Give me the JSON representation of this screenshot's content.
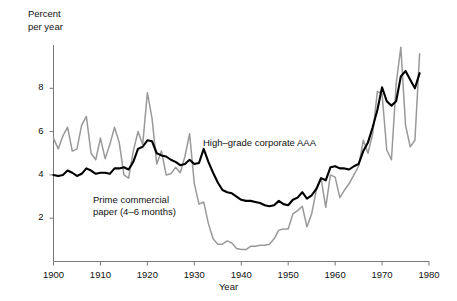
{
  "chart_data": {
    "type": "line",
    "title": "",
    "xlabel": "Year",
    "ylabel": "Percent per year",
    "ylabel_line1": "Percent",
    "ylabel_line2": "per year",
    "xlim": [
      1900,
      1980
    ],
    "ylim": [
      0,
      10
    ],
    "xticks": [
      1900,
      1910,
      1920,
      1930,
      1940,
      1950,
      1960,
      1970,
      1980
    ],
    "yticks": [
      2,
      4,
      6,
      8
    ],
    "grid": false,
    "legend": "inline-annotations",
    "colors": {
      "high_grade_corporate_aaa": "#000000",
      "prime_commercial_paper": "#999999",
      "axis": "#777777",
      "text": "#111111",
      "background": "#ffffff"
    },
    "series": [
      {
        "name": "High-grade corporate AAA",
        "label": "High–grade corporate AAA",
        "color": "#000000",
        "x": [
          1900,
          1901,
          1902,
          1903,
          1904,
          1905,
          1906,
          1907,
          1908,
          1909,
          1910,
          1911,
          1912,
          1913,
          1914,
          1915,
          1916,
          1917,
          1918,
          1919,
          1920,
          1921,
          1922,
          1923,
          1924,
          1925,
          1926,
          1927,
          1928,
          1929,
          1930,
          1931,
          1932,
          1933,
          1934,
          1935,
          1936,
          1937,
          1938,
          1939,
          1940,
          1941,
          1942,
          1943,
          1944,
          1945,
          1946,
          1947,
          1948,
          1949,
          1950,
          1951,
          1952,
          1953,
          1954,
          1955,
          1956,
          1957,
          1958,
          1959,
          1960,
          1961,
          1962,
          1963,
          1964,
          1965,
          1966,
          1967,
          1968,
          1969,
          1970,
          1971,
          1972,
          1973,
          1974,
          1975,
          1976,
          1977,
          1978
        ],
        "values": [
          4.0,
          3.95,
          4.0,
          4.2,
          4.1,
          3.95,
          4.05,
          4.3,
          4.2,
          4.05,
          4.1,
          4.1,
          4.05,
          4.3,
          4.3,
          4.35,
          4.25,
          4.6,
          5.2,
          5.3,
          5.6,
          5.55,
          5.0,
          4.9,
          4.85,
          4.7,
          4.6,
          4.45,
          4.5,
          4.7,
          4.5,
          4.55,
          5.2,
          4.6,
          4.1,
          3.65,
          3.3,
          3.2,
          3.15,
          3.0,
          2.85,
          2.8,
          2.8,
          2.75,
          2.7,
          2.6,
          2.55,
          2.6,
          2.8,
          2.65,
          2.6,
          2.85,
          2.95,
          3.2,
          2.9,
          3.05,
          3.35,
          3.85,
          3.75,
          4.35,
          4.4,
          4.3,
          4.3,
          4.25,
          4.4,
          4.5,
          5.1,
          5.5,
          6.2,
          7.0,
          8.05,
          7.4,
          7.2,
          7.4,
          8.55,
          8.8,
          8.4,
          8.0,
          8.7
        ]
      },
      {
        "name": "Prime commercial paper (4-6 months)",
        "label": "Prime commercial paper (4–6 months)",
        "color": "#999999",
        "x": [
          1900,
          1901,
          1902,
          1903,
          1904,
          1905,
          1906,
          1907,
          1908,
          1909,
          1910,
          1911,
          1912,
          1913,
          1914,
          1915,
          1916,
          1917,
          1918,
          1919,
          1920,
          1921,
          1922,
          1923,
          1924,
          1925,
          1926,
          1927,
          1928,
          1929,
          1930,
          1931,
          1932,
          1933,
          1934,
          1935,
          1936,
          1937,
          1938,
          1939,
          1940,
          1941,
          1942,
          1943,
          1944,
          1945,
          1946,
          1947,
          1948,
          1949,
          1950,
          1951,
          1952,
          1953,
          1954,
          1955,
          1956,
          1957,
          1958,
          1959,
          1960,
          1961,
          1962,
          1963,
          1964,
          1965,
          1966,
          1967,
          1968,
          1969,
          1970,
          1971,
          1972,
          1973,
          1974,
          1975,
          1976,
          1977,
          1978
        ],
        "values": [
          5.7,
          5.2,
          5.8,
          6.2,
          5.1,
          5.2,
          6.3,
          6.7,
          5.0,
          4.7,
          5.7,
          4.75,
          5.4,
          6.2,
          5.5,
          4.0,
          3.85,
          5.1,
          6.0,
          5.4,
          7.8,
          6.6,
          4.5,
          5.1,
          4.0,
          4.05,
          4.35,
          4.1,
          4.85,
          5.9,
          3.6,
          2.65,
          2.75,
          1.75,
          1.05,
          0.8,
          0.8,
          0.95,
          0.85,
          0.6,
          0.55,
          0.55,
          0.7,
          0.7,
          0.75,
          0.75,
          0.8,
          1.05,
          1.45,
          1.5,
          1.5,
          2.2,
          2.35,
          2.55,
          1.6,
          2.2,
          3.3,
          3.85,
          2.5,
          4.0,
          3.9,
          2.95,
          3.3,
          3.6,
          4.0,
          4.4,
          5.6,
          5.0,
          5.9,
          7.85,
          7.75,
          5.15,
          4.7,
          8.2,
          9.9,
          6.3,
          5.3,
          5.6,
          9.6
        ]
      }
    ]
  }
}
